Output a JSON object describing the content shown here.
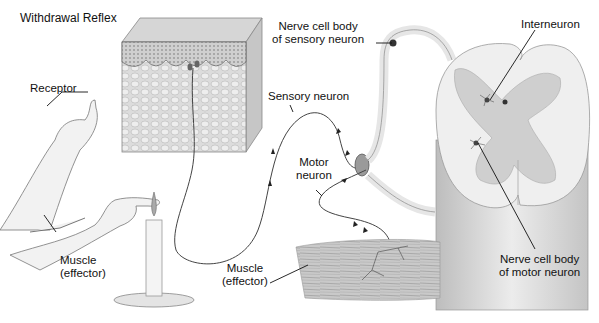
{
  "title": "Withdrawal Reflex",
  "labels": {
    "receptor": "Receptor",
    "muscle_left": {
      "line1": "Muscle",
      "line2": "(effector)"
    },
    "muscle_center": {
      "line1": "Muscle",
      "line2": "(effector)"
    },
    "sensory_neuron": "Sensory neuron",
    "motor_neuron": {
      "line1": "Motor",
      "line2": "neuron"
    },
    "sensory_cell_body": {
      "line1": "Nerve cell body",
      "line2": "of sensory neuron"
    },
    "interneuron": "Interneuron",
    "motor_cell_body": {
      "line1": "Nerve cell body",
      "line2": "of motor neuron"
    }
  },
  "colors": {
    "ink": "#111111",
    "skin_top": "#d8d8d8",
    "skin_side": "#cfcfcf",
    "grey_matter": "#cfcfcf",
    "white_matter": "#efefef",
    "muscle": "#bdbdbd"
  }
}
